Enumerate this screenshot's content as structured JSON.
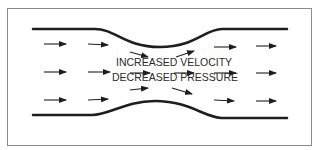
{
  "diagram": {
    "labels": {
      "line1": "INCREASED VELOCITY",
      "line2": "DECREASED PRESSURE"
    },
    "colors": {
      "frame": "#8a8a8a",
      "wall": "#1e1e1e",
      "arrow": "#1e1e1e",
      "text": "#2a2a2a",
      "background": "#ffffff"
    },
    "arrows": [
      {
        "row": "top",
        "x1": 44,
        "y1": 44,
        "x2": 66,
        "y2": 44
      },
      {
        "row": "top",
        "x1": 88,
        "y1": 44,
        "x2": 108,
        "y2": 45
      },
      {
        "row": "top",
        "x1": 130,
        "y1": 52,
        "x2": 148,
        "y2": 57
      },
      {
        "row": "top",
        "x1": 176,
        "y1": 57,
        "x2": 194,
        "y2": 51
      },
      {
        "row": "top",
        "x1": 214,
        "y1": 47,
        "x2": 236,
        "y2": 47
      },
      {
        "row": "top",
        "x1": 256,
        "y1": 46,
        "x2": 276,
        "y2": 46
      },
      {
        "row": "middle",
        "x1": 44,
        "y1": 72,
        "x2": 66,
        "y2": 72
      },
      {
        "row": "middle",
        "x1": 88,
        "y1": 72,
        "x2": 110,
        "y2": 72
      },
      {
        "row": "middle",
        "x1": 130,
        "y1": 73,
        "x2": 150,
        "y2": 73
      },
      {
        "row": "middle",
        "x1": 174,
        "y1": 73,
        "x2": 194,
        "y2": 73
      },
      {
        "row": "middle",
        "x1": 214,
        "y1": 73,
        "x2": 236,
        "y2": 73
      },
      {
        "row": "middle",
        "x1": 256,
        "y1": 73,
        "x2": 276,
        "y2": 73
      },
      {
        "row": "bottom",
        "x1": 44,
        "y1": 100,
        "x2": 66,
        "y2": 100
      },
      {
        "row": "bottom",
        "x1": 88,
        "y1": 100,
        "x2": 108,
        "y2": 99
      },
      {
        "row": "bottom",
        "x1": 130,
        "y1": 90,
        "x2": 148,
        "y2": 88
      },
      {
        "row": "bottom",
        "x1": 172,
        "y1": 88,
        "x2": 192,
        "y2": 94
      },
      {
        "row": "bottom",
        "x1": 214,
        "y1": 100,
        "x2": 234,
        "y2": 101
      },
      {
        "row": "bottom",
        "x1": 256,
        "y1": 101,
        "x2": 276,
        "y2": 101
      }
    ]
  }
}
